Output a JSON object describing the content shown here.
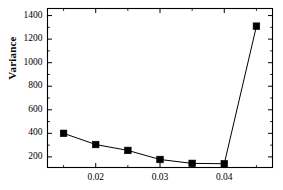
{
  "chart_data": {
    "type": "line",
    "title": "",
    "xlabel": "",
    "ylabel": "Variance",
    "x": [
      0.015,
      0.02,
      0.025,
      0.03,
      0.035,
      0.04,
      0.045
    ],
    "values": [
      400,
      305,
      255,
      178,
      145,
      142,
      1310
    ],
    "series": [
      {
        "name": "Variance",
        "x": [
          0.015,
          0.02,
          0.025,
          0.03,
          0.035,
          0.04,
          0.045
        ],
        "values": [
          400,
          305,
          255,
          178,
          145,
          142,
          1310
        ],
        "marker": "filled-square",
        "color": "#000000",
        "line_color": "#000000"
      }
    ],
    "xlim": [
      0.0125,
      0.0475
    ],
    "ylim": [
      110,
      1460
    ],
    "xticks": [
      0.02,
      0.03,
      0.04
    ],
    "xtick_labels": [
      "0.02",
      "0.03",
      "0.04"
    ],
    "xticks_minor": [
      0.015,
      0.025,
      0.035,
      0.045
    ],
    "yticks": [
      200,
      400,
      600,
      800,
      1000,
      1200,
      1400
    ],
    "ytick_labels": [
      "200",
      "400",
      "600",
      "800",
      "1000",
      "1200",
      "1400"
    ],
    "yticks_minor": [
      300,
      500,
      700,
      900,
      1100,
      1300
    ],
    "grid": false,
    "legend": null,
    "frame": true,
    "background": "#ffffff",
    "axis_color": "#000000"
  }
}
